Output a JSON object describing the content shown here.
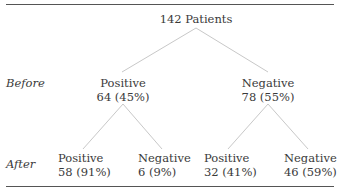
{
  "diagram": {
    "type": "tree",
    "root": {
      "label": "142 Patients"
    },
    "row_labels": {
      "before": "Before",
      "after": "After"
    },
    "before": [
      {
        "label": "Positive",
        "value": "64 (45%)"
      },
      {
        "label": "Negative",
        "value": "78 (55%)"
      }
    ],
    "after": [
      {
        "label": "Positive",
        "value": "58 (91%)"
      },
      {
        "label": "Negative",
        "value": "6 (9%)"
      },
      {
        "label": "Positive",
        "value": "32 (41%)"
      },
      {
        "label": "Negative",
        "value": "46 (59%)"
      }
    ],
    "colors": {
      "edge": "#c8c8c8",
      "rule": "#555555",
      "text": "#3a3a3a"
    }
  }
}
